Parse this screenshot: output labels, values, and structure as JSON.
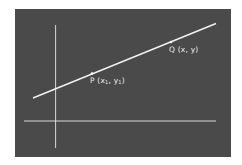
{
  "diagram": {
    "title": "",
    "background_color": "#4a4a4a",
    "line_color": "#f0f0f0",
    "axes": {
      "x_axis": "horizontal",
      "y_axis": "vertical"
    },
    "line": {
      "description": "straight line through points P and Q"
    },
    "points": [
      {
        "id": "P",
        "label_name": "P",
        "label_coords": "(x",
        "sub1": "1",
        "mid": ", y",
        "sub2": "1",
        "close": ")"
      },
      {
        "id": "Q",
        "label_name": "Q",
        "label_coords": "(x, y)"
      }
    ]
  }
}
